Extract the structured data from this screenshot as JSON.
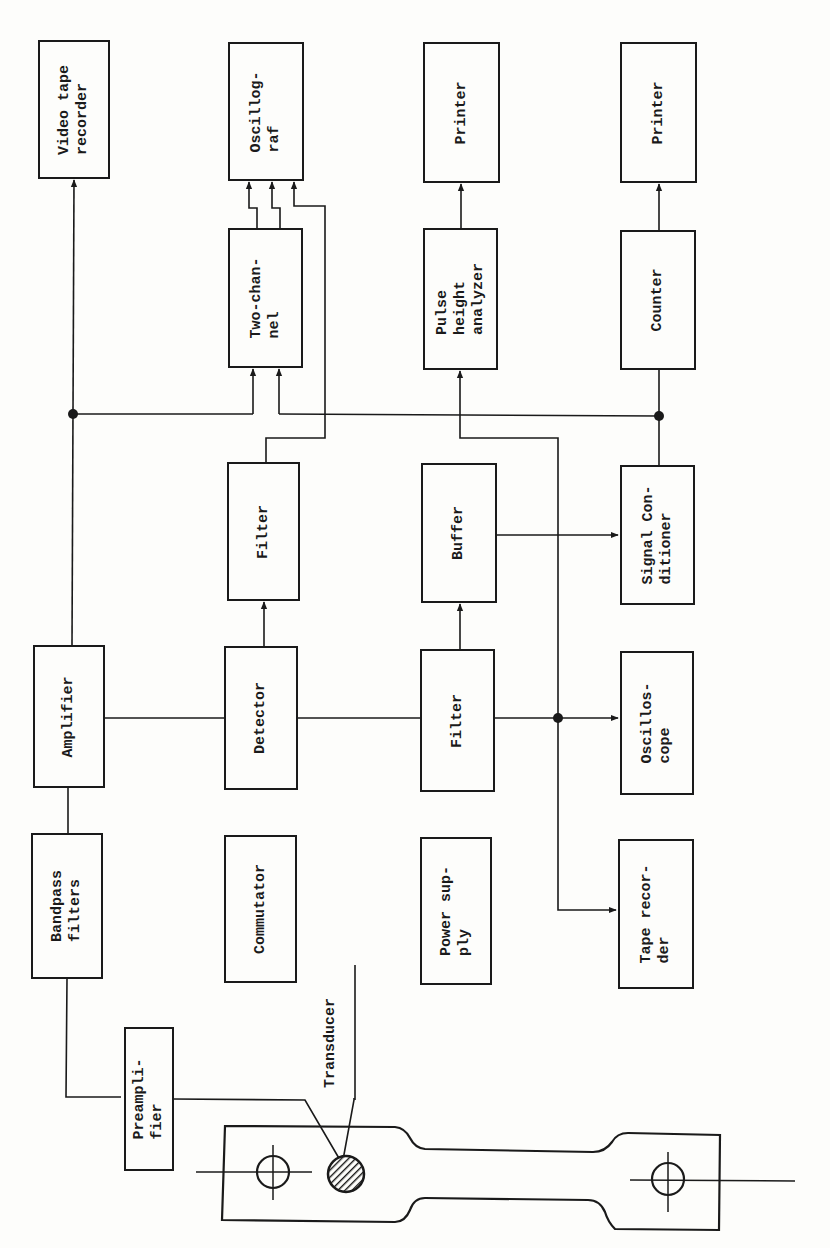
{
  "diagram": {
    "orientation": "rotated-90-ccw",
    "stroke_color": "#1a1a1a",
    "background": "#fdfdfb",
    "blocks": [
      {
        "id": "video_tape_recorder",
        "label": "Video tape\nrecorder"
      },
      {
        "id": "oscillograf",
        "label": "Oscillog-\nraf"
      },
      {
        "id": "printer_1",
        "label": "Printer"
      },
      {
        "id": "printer_2",
        "label": "Printer"
      },
      {
        "id": "two_channel",
        "label": "Two-chan-\nnel"
      },
      {
        "id": "pulse_height_analyzer",
        "label": "Pulse\nheight\nanalyzer"
      },
      {
        "id": "counter",
        "label": "Counter"
      },
      {
        "id": "filter_1",
        "label": "Filter"
      },
      {
        "id": "buffer",
        "label": "Buffer"
      },
      {
        "id": "signal_conditioner",
        "label": "Signal Con-\nditioner"
      },
      {
        "id": "amplifier",
        "label": "Amplifier"
      },
      {
        "id": "detector",
        "label": "Detector"
      },
      {
        "id": "filter_2",
        "label": "Filter"
      },
      {
        "id": "oscilloscope",
        "label": "Oscillos-\ncope"
      },
      {
        "id": "bandpass_filters",
        "label": "Bandpass\nfilters"
      },
      {
        "id": "commutator",
        "label": "Commutator"
      },
      {
        "id": "power_supply",
        "label": "Power sup-\nply"
      },
      {
        "id": "tape_recorder",
        "label": "Tape recor-\nder"
      },
      {
        "id": "preamplifier",
        "label": "Preampli-\nfier"
      }
    ],
    "annotations": {
      "transducer": "Transducer"
    },
    "specimen": "Test specimen with two pin holes and transducer (hatched circle)",
    "connections": [
      {
        "from": "transducer",
        "to": "preamplifier"
      },
      {
        "from": "preamplifier",
        "to": "bandpass_filters"
      },
      {
        "from": "bandpass_filters",
        "to": "amplifier"
      },
      {
        "from": "amplifier",
        "to": "video_tape_recorder"
      },
      {
        "from": "amplifier",
        "to": "two_channel"
      },
      {
        "from": "amplifier",
        "to": "detector"
      },
      {
        "from": "detector",
        "to": "filter_1"
      },
      {
        "from": "filter_1",
        "to": "oscillograf"
      },
      {
        "from": "two_channel",
        "to": "oscillograf",
        "count": 2
      },
      {
        "from": "detector",
        "to": "filter_2"
      },
      {
        "from": "filter_2",
        "to": "buffer"
      },
      {
        "from": "filter_2",
        "to": "oscilloscope"
      },
      {
        "from": "filter_2",
        "to": "tape_recorder"
      },
      {
        "from": "filter_2",
        "to": "pulse_height_analyzer"
      },
      {
        "from": "buffer",
        "to": "signal_conditioner"
      },
      {
        "from": "signal_conditioner",
        "to": "counter"
      },
      {
        "from": "signal_conditioner",
        "to": "two_channel"
      },
      {
        "from": "pulse_height_analyzer",
        "to": "printer_1"
      },
      {
        "from": "counter",
        "to": "printer_2"
      }
    ]
  }
}
